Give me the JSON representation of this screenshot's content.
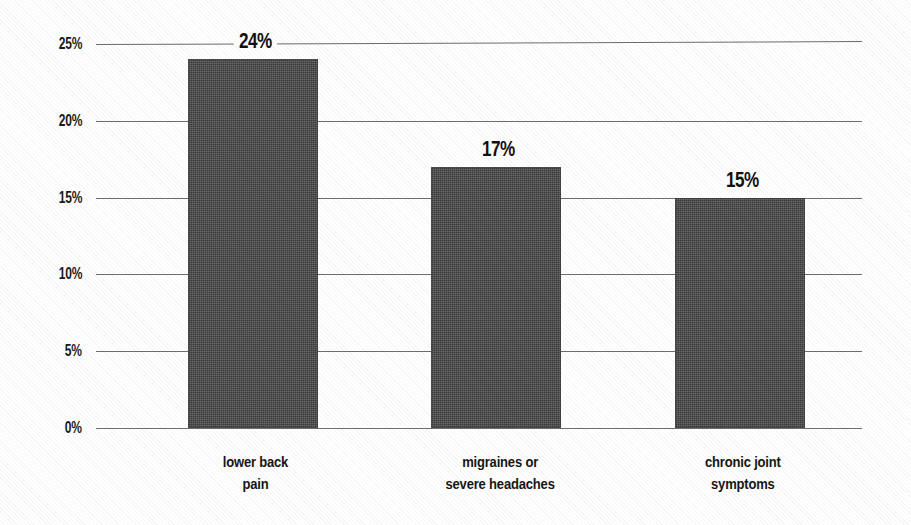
{
  "chart_data": {
    "type": "bar",
    "title": "",
    "subtitle": "",
    "xlabel": "",
    "ylabel": "",
    "categories": [
      "lower back pain",
      "migraines or severe headaches",
      "chronic joint symptoms"
    ],
    "category_lines": [
      [
        "lower back",
        "pain"
      ],
      [
        "migraines or",
        "severe headaches"
      ],
      [
        "chronic joint",
        "symptoms"
      ]
    ],
    "values": [
      24,
      17,
      15
    ],
    "value_labels": [
      "24%",
      "17%",
      "15%"
    ],
    "ylim": [
      0,
      25
    ],
    "ytick_values": [
      0,
      5,
      10,
      15,
      20,
      25
    ],
    "ytick_labels": [
      "0%",
      "5%",
      "10%",
      "15%",
      "20%",
      "25%"
    ],
    "grid": true,
    "grid_axis": "y",
    "legend": false,
    "legend_position": "none",
    "bar_color": "#474747",
    "gridline_color": "#6e6e6e",
    "text_color": "#1a1a1a",
    "background_color": "#ffffff"
  }
}
